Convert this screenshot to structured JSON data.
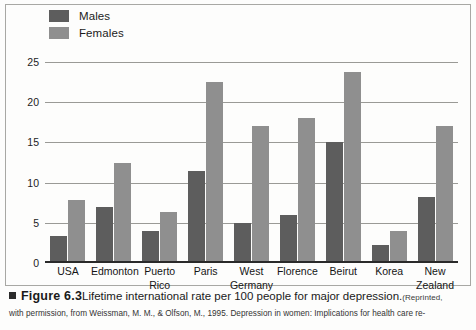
{
  "chart_data": {
    "type": "bar",
    "title": "",
    "xlabel": "",
    "ylabel": "Lifetime rate per 100 people",
    "ylim": [
      0,
      25
    ],
    "yticks": [
      0,
      5,
      10,
      15,
      20,
      25
    ],
    "grid": true,
    "legend_position": "top-left",
    "categories": [
      "USA",
      "Edmonton",
      "Puerto\nRico",
      "Paris",
      "West\nGermany",
      "Florence",
      "Beirut",
      "Korea",
      "New\nZealand"
    ],
    "series": [
      {
        "name": "Males",
        "color": "#5d5d5d",
        "values": [
          3.3,
          7.0,
          4.0,
          11.5,
          5.0,
          6.0,
          15.0,
          2.3,
          8.2
        ]
      },
      {
        "name": "Females",
        "color": "#8f8f8f",
        "values": [
          7.8,
          12.5,
          6.3,
          22.5,
          17.0,
          18.0,
          23.7,
          4.0,
          17.0
        ]
      }
    ]
  },
  "caption": {
    "figure_number": "Figure 6.3",
    "main_text": "Lifetime international rate per 100 people for major depression.",
    "source_open": "(Reprinted,",
    "line2": "with permission, from Weissman, M. M., & Olfson, M., 1995. Depression in women: Implications for health care re-"
  }
}
